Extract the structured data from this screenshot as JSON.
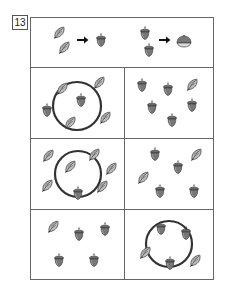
{
  "problem_number": "13",
  "rules": {
    "rule1": {
      "from": [
        "leaf",
        "leaf"
      ],
      "to": "acorn",
      "arrow": "arrow-right-icon"
    },
    "rule2": {
      "from": [
        "acorn",
        "acorn"
      ],
      "to": "chestnut",
      "arrow": "arrow-right-icon"
    }
  },
  "panels": [
    {
      "id": "row1-left",
      "circled": true,
      "items": [
        "leaf",
        "leaf",
        "acorn",
        "leaf",
        "acorn",
        "leaf"
      ]
    },
    {
      "id": "row1-right",
      "circled": false,
      "items": [
        "acorn",
        "acorn",
        "leaf",
        "acorn",
        "acorn",
        "acorn"
      ]
    },
    {
      "id": "row2-left",
      "circled": true,
      "items": [
        "leaf",
        "leaf",
        "leaf",
        "leaf",
        "leaf",
        "leaf",
        "acorn"
      ]
    },
    {
      "id": "row2-right",
      "circled": false,
      "items": [
        "acorn",
        "leaf",
        "acorn",
        "leaf",
        "acorn",
        "acorn"
      ]
    },
    {
      "id": "row3-left",
      "circled": false,
      "items": [
        "leaf",
        "acorn",
        "acorn",
        "acorn",
        "acorn"
      ]
    },
    {
      "id": "row3-right",
      "circled": true,
      "items": [
        "acorn",
        "acorn",
        "leaf",
        "acorn",
        "leaf"
      ]
    }
  ],
  "colors": {
    "line": "#666666",
    "icon_dark": "#555555",
    "icon_mid": "#888888",
    "icon_light": "#bbbbbb",
    "circle": "#333333"
  }
}
